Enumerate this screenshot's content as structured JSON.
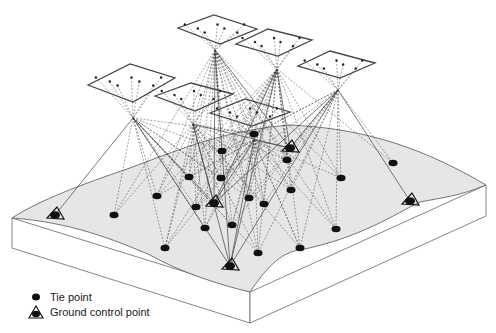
{
  "diagram": {
    "type": "aerial-triangulation-block",
    "colors": {
      "terrain_top": "#e6e6e6",
      "terrain_side": "#ffffff",
      "outline": "#555555",
      "ray": "#444444",
      "point": "#111111"
    },
    "photos": [
      {
        "name": "photo-1",
        "corners": [
          [
            88,
            85
          ],
          [
            130,
            64
          ],
          [
            175,
            78
          ],
          [
            133,
            102
          ]
        ],
        "center": [
          133,
          118
        ]
      },
      {
        "name": "photo-2",
        "corners": [
          [
            155,
            96
          ],
          [
            191,
            83
          ],
          [
            233,
            94
          ],
          [
            195,
            111
          ]
        ],
        "center": [
          193,
          124
        ]
      },
      {
        "name": "photo-3",
        "corners": [
          [
            178,
            28
          ],
          [
            214,
            15
          ],
          [
            257,
            29
          ],
          [
            220,
            44
          ]
        ],
        "center": [
          215,
          50
        ]
      },
      {
        "name": "photo-4",
        "corners": [
          [
            236,
            44
          ],
          [
            268,
            29
          ],
          [
            312,
            40
          ],
          [
            278,
            56
          ]
        ],
        "center": [
          277,
          69
        ]
      },
      {
        "name": "photo-5",
        "corners": [
          [
            298,
            66
          ],
          [
            330,
            51
          ],
          [
            375,
            63
          ],
          [
            340,
            78
          ]
        ],
        "center": [
          338,
          90
        ]
      },
      {
        "name": "photo-6",
        "corners": [
          [
            210,
            113
          ],
          [
            245,
            99
          ],
          [
            290,
            112
          ],
          [
            252,
            126
          ]
        ],
        "center": [
          254,
          140
        ]
      }
    ],
    "tie_points": [
      [
        114,
        215
      ],
      [
        157,
        196
      ],
      [
        189,
        177
      ],
      [
        222,
        151
      ],
      [
        254,
        134
      ],
      [
        291,
        190
      ],
      [
        287,
        160
      ],
      [
        341,
        178
      ],
      [
        300,
        248
      ],
      [
        393,
        163
      ],
      [
        165,
        248
      ],
      [
        205,
        228
      ],
      [
        258,
        253
      ],
      [
        232,
        225
      ],
      [
        196,
        207
      ],
      [
        336,
        229
      ],
      [
        249,
        198
      ],
      [
        264,
        204
      ],
      [
        221,
        178
      ]
    ],
    "control_points": [
      [
        55,
        215
      ],
      [
        214,
        203
      ],
      [
        290,
        148
      ],
      [
        410,
        201
      ],
      [
        230,
        266
      ]
    ]
  },
  "legend": {
    "items": [
      {
        "symbol": "tie-point",
        "label": "Tie point"
      },
      {
        "symbol": "ground-control-point",
        "label": "Ground control point"
      }
    ]
  }
}
